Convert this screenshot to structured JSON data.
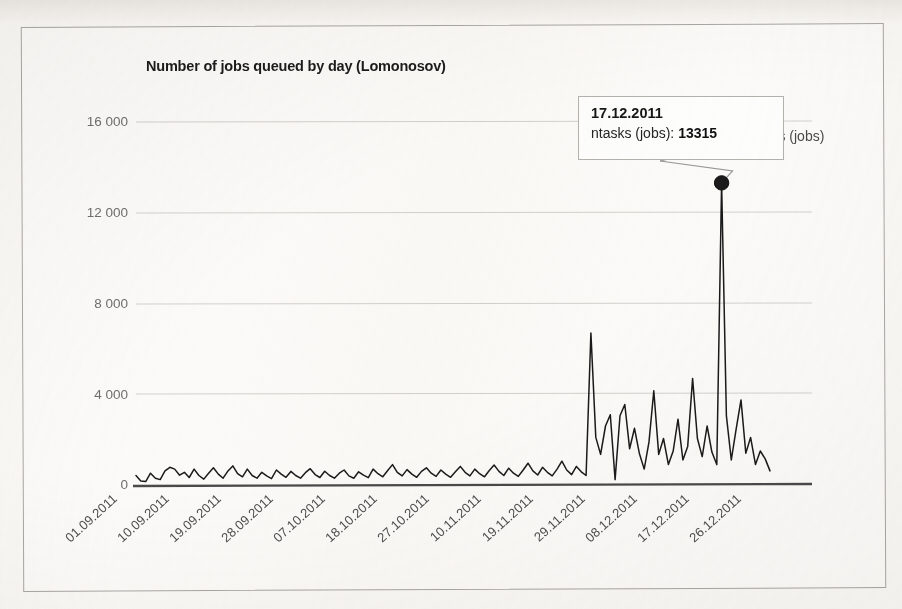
{
  "chart_data": {
    "type": "line",
    "title": "Number of jobs queued by day (Lomonosov)",
    "xlabel": "",
    "ylabel": "",
    "ylim": [
      0,
      16000
    ],
    "yticks": [
      0,
      4000,
      8000,
      12000,
      16000
    ],
    "ytick_labels": [
      "0",
      "4 000",
      "8 000",
      "12 000",
      "16 000"
    ],
    "grid": "horizontal",
    "legend_position": "right",
    "series": [
      {
        "name": "ntasks (jobs)",
        "color": "#1a1a1a",
        "values": [
          420,
          180,
          150,
          520,
          300,
          240,
          620,
          780,
          700,
          430,
          560,
          330,
          700,
          420,
          260,
          520,
          760,
          480,
          300,
          620,
          840,
          500,
          360,
          700,
          420,
          300,
          560,
          400,
          280,
          660,
          480,
          340,
          600,
          420,
          300,
          540,
          720,
          460,
          330,
          610,
          420,
          300,
          520,
          660,
          400,
          300,
          580,
          430,
          320,
          700,
          500,
          360,
          640,
          900,
          560,
          400,
          680,
          480,
          340,
          600,
          760,
          520,
          380,
          660,
          480,
          340,
          580,
          820,
          560,
          400,
          700,
          500,
          360,
          640,
          880,
          600,
          420,
          740,
          520,
          380,
          660,
          960,
          620,
          440,
          780,
          560,
          400,
          700,
          1050,
          660,
          460,
          820,
          580,
          420,
          6700,
          2100,
          1350,
          2600,
          3100,
          240,
          3050,
          3550,
          1600,
          2500,
          1400,
          700,
          1900,
          4150,
          1350,
          2050,
          900,
          1500,
          2900,
          1100,
          1700,
          4700,
          2050,
          1250,
          2600,
          1450,
          900,
          13315,
          3050,
          1100,
          2450,
          3750,
          1400,
          2100,
          900,
          1500,
          1150,
          620
        ]
      }
    ],
    "x_tick_labels": [
      "01.09.2011",
      "10.09.2011",
      "19.09.2011",
      "28.09.2011",
      "07.10.2011",
      "18.10.2011",
      "27.10.2011",
      "10.11.2011",
      "19.11.2011",
      "29.11.2011",
      "08.12.2011",
      "17.12.2011",
      "26.12.2011"
    ],
    "annotation": {
      "date": "17.12.2011",
      "series_label": "ntasks (jobs):",
      "value": "13315",
      "marker": "point-marker"
    }
  },
  "legend": {
    "label": "ntasks (jobs)"
  }
}
